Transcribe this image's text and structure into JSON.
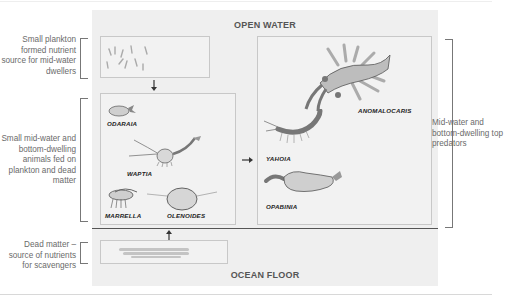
{
  "zones": {
    "top_label": "OPEN WATER",
    "bottom_label": "OCEAN FLOOR"
  },
  "annotations": {
    "plankton": "Small plankton formed nutrient source for mid-water dwellers",
    "small_animals": "Small mid-water and bottom-dwelling animals fed on plankton and dead matter",
    "dead_matter": "Dead matter – source of nutrients for scavengers",
    "predators": "Mid-water and bottom-dwelling top predators"
  },
  "boxes": {
    "plankton": {
      "icon": "plankton-illustration"
    },
    "small_animals": {
      "species": [
        "ODARAIA",
        "WAPTIA",
        "MARRELLA",
        "OLENOIDES"
      ]
    },
    "predators": {
      "species": [
        "ANOMALOCARIS",
        "YAHOIA",
        "OPABINIA"
      ]
    },
    "dead_matter": {
      "icon": "sediment-illustration"
    }
  },
  "arrows": [
    {
      "from": "plankton",
      "to": "small_animals",
      "direction": "down"
    },
    {
      "from": "dead_matter",
      "to": "small_animals",
      "direction": "up"
    },
    {
      "from": "small_animals",
      "to": "predators",
      "direction": "right"
    }
  ],
  "colors": {
    "panel_bg": "#efefef",
    "box_border": "#c8c8c8",
    "text_gray": "#6a6a6a",
    "species_label": "#222222",
    "anomalocaris_fan": "#9a9a9a"
  }
}
